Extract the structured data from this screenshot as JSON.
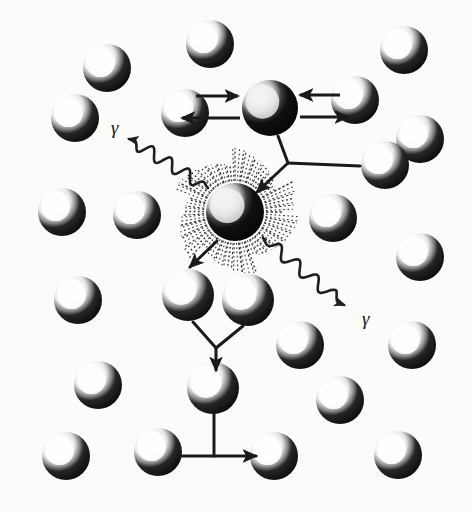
{
  "figure": {
    "background_color": "#fbfbfa",
    "ink_color": "#1a1a1a",
    "width": 473,
    "height": 511
  },
  "labels": {
    "gamma_left": "γ",
    "gamma_right": "γ"
  },
  "atoms": {
    "radius": 24,
    "highlight_color": "#ffffff",
    "shadow_color": "#0d0d0d",
    "lattice": [
      {
        "name": "atom-r1-c1",
        "cx": 107,
        "cy": 68
      },
      {
        "name": "atom-r1-c2",
        "cx": 210,
        "cy": 44
      },
      {
        "name": "atom-r1-c3",
        "cx": 404,
        "cy": 50
      },
      {
        "name": "atom-r2-c1",
        "cx": 75,
        "cy": 118
      },
      {
        "name": "atom-r2-c2",
        "cx": 185,
        "cy": 113
      },
      {
        "name": "atom-r2-c3",
        "cx": 355,
        "cy": 100
      },
      {
        "name": "atom-r2-c4",
        "cx": 420,
        "cy": 139
      },
      {
        "name": "atom-r3-c1",
        "cx": 62,
        "cy": 212
      },
      {
        "name": "atom-r3-c2",
        "cx": 137,
        "cy": 215
      },
      {
        "name": "atom-r3-c3",
        "cx": 385,
        "cy": 165
      },
      {
        "name": "atom-r3-c4",
        "cx": 333,
        "cy": 218
      },
      {
        "name": "atom-r4-c1",
        "cx": 78,
        "cy": 300
      },
      {
        "name": "atom-r4-c2",
        "cx": 420,
        "cy": 257
      },
      {
        "name": "atom-r5-c1",
        "cx": 98,
        "cy": 385
      },
      {
        "name": "atom-r5-c2",
        "cx": 300,
        "cy": 345
      },
      {
        "name": "atom-r5-c3",
        "cx": 412,
        "cy": 345
      },
      {
        "name": "atom-r6-c1",
        "cx": 66,
        "cy": 456
      },
      {
        "name": "atom-r6-c2",
        "cx": 158,
        "cy": 452
      },
      {
        "name": "atom-r6-c3",
        "cx": 340,
        "cy": 400
      },
      {
        "name": "atom-r6-c4",
        "cx": 274,
        "cy": 456
      },
      {
        "name": "atom-r6-c5",
        "cx": 398,
        "cy": 455
      }
    ],
    "cascade": [
      {
        "name": "atom-pka",
        "cx": 270,
        "cy": 108,
        "radius": 28,
        "dark": true
      },
      {
        "name": "atom-burst",
        "cx": 235,
        "cy": 212,
        "radius": 29,
        "dark": true,
        "burst": true
      },
      {
        "name": "atom-branch-left",
        "cx": 188,
        "cy": 295,
        "radius": 26
      },
      {
        "name": "atom-branch-right",
        "cx": 248,
        "cy": 300,
        "radius": 26
      },
      {
        "name": "atom-lower",
        "cx": 213,
        "cy": 388,
        "radius": 26
      }
    ]
  },
  "arrows": {
    "recoil": [
      {
        "name": "arrow-recoil-left-in",
        "x1": 196,
        "y1": 96,
        "x2": 238,
        "y2": 96
      },
      {
        "name": "arrow-recoil-left-out",
        "x1": 240,
        "y1": 118,
        "x2": 182,
        "y2": 118
      },
      {
        "name": "arrow-recoil-right-in",
        "x1": 340,
        "y1": 95,
        "x2": 300,
        "y2": 95
      },
      {
        "name": "arrow-recoil-right-out",
        "x1": 300,
        "y1": 117,
        "x2": 348,
        "y2": 117
      }
    ],
    "cascade_links": [
      {
        "name": "link-pka-to-junction",
        "path": "M 278 136 L 288 163"
      },
      {
        "name": "link-right-atom-to-junction",
        "path": "M 288 163 L 360 166"
      },
      {
        "name": "arrow-junction-to-burst",
        "path": "M 288 163 L 257 192"
      },
      {
        "name": "arrow-burst-to-branch-left",
        "path": "M 217 241 L 190 267"
      },
      {
        "name": "link-branch-left-to-node",
        "path": "M 193 322 L 216 348"
      },
      {
        "name": "link-branch-right-to-node",
        "path": "M 243 326 L 216 348"
      },
      {
        "name": "arrow-node-to-lower-atom",
        "path": "M 216 348 L 216 370"
      },
      {
        "name": "link-lower-atom-down",
        "path": "M 214 414 L 214 456"
      },
      {
        "name": "arrow-lower-to-right-atom",
        "path": "M 182 456 L 256 456"
      }
    ],
    "gamma_rays": [
      {
        "name": "gamma-ray-upper-left",
        "from": [
          208,
          188
        ],
        "to": [
          129,
          139
        ]
      },
      {
        "name": "gamma-ray-lower-right",
        "from": [
          263,
          238
        ],
        "to": [
          344,
          305
        ]
      }
    ]
  }
}
